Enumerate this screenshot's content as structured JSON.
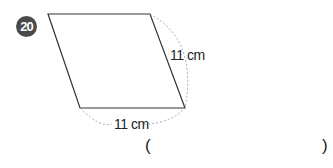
{
  "problem": {
    "number": "20",
    "side_right_label": "11 cm",
    "side_bottom_label": "11 cm",
    "answer_open": "(",
    "answer_close": ")",
    "answer_value": ""
  },
  "colors": {
    "badge": "#4a4a4a",
    "line": "#333333",
    "dashed": "#aaaaaa"
  }
}
